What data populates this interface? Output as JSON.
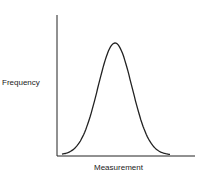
{
  "chart_data": {
    "type": "line",
    "title": "",
    "xlabel": "Measurement",
    "ylabel": "Frequency",
    "grid": false,
    "legend": null,
    "series": [
      {
        "name": "distribution",
        "x": [
          0,
          0.1,
          0.2,
          0.3,
          0.4,
          0.5,
          0.6,
          0.7,
          0.8,
          0.9,
          1.0
        ],
        "values": [
          0.01,
          0.05,
          0.2,
          0.55,
          0.9,
          1.0,
          0.9,
          0.55,
          0.2,
          0.05,
          0.01
        ]
      }
    ],
    "colors": {
      "axis": "#222222",
      "curve": "#222222"
    }
  }
}
